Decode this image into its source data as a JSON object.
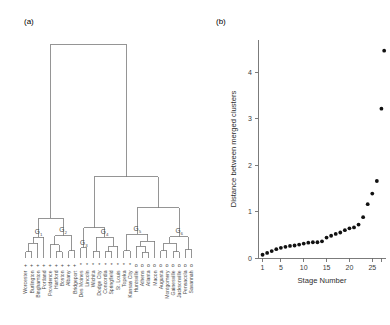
{
  "figure": {
    "panel_a_label": "(a)",
    "panel_b_label": "(b)"
  },
  "panel_a": {
    "type": "dendrogram",
    "group_labels": [
      "G",
      "G",
      "G",
      "G",
      "G",
      "G"
    ],
    "group_subscripts": [
      "1",
      "2",
      "3",
      "4",
      "5",
      "6"
    ],
    "leaves": [
      {
        "name": "Worcester",
        "symbol": "+",
        "group": "G1"
      },
      {
        "name": "Burlington",
        "symbol": "+",
        "group": "G1"
      },
      {
        "name": "Binghamton",
        "symbol": "+",
        "group": "G1"
      },
      {
        "name": "Portland",
        "symbol": "+",
        "group": "G1"
      },
      {
        "name": "Providence",
        "symbol": "+",
        "group": "G2"
      },
      {
        "name": "Hartford",
        "symbol": "+",
        "group": "G2"
      },
      {
        "name": "Boston",
        "symbol": "+",
        "group": "G2"
      },
      {
        "name": "Albany",
        "symbol": "+",
        "group": "G2"
      },
      {
        "name": "Bridgeport",
        "symbol": "+",
        "group": "G2"
      },
      {
        "name": "Des Moines",
        "symbol": "*",
        "group": "G3"
      },
      {
        "name": "Lincoln",
        "symbol": "*",
        "group": "G3"
      },
      {
        "name": "Wichita",
        "symbol": "*",
        "group": "G4"
      },
      {
        "name": "Dodge City",
        "symbol": "*",
        "group": "G4"
      },
      {
        "name": "Concordia",
        "symbol": "*",
        "group": "G4"
      },
      {
        "name": "Springfield",
        "symbol": "*",
        "group": "G4"
      },
      {
        "name": "St. Louis",
        "symbol": "*",
        "group": "G4"
      },
      {
        "name": "Topeka",
        "symbol": "*",
        "group": "G5"
      },
      {
        "name": "Kansas City",
        "symbol": "*",
        "group": "G5"
      },
      {
        "name": "Huntsville",
        "symbol": "o",
        "group": "G5"
      },
      {
        "name": "Athens",
        "symbol": "o",
        "group": "G5"
      },
      {
        "name": "Atlanta",
        "symbol": "o",
        "group": "G5"
      },
      {
        "name": "Macon",
        "symbol": "o",
        "group": "G5"
      },
      {
        "name": "Augusta",
        "symbol": "o",
        "group": "G6"
      },
      {
        "name": "Montgomery",
        "symbol": "o",
        "group": "G6"
      },
      {
        "name": "Gainesville",
        "symbol": "o",
        "group": "G6"
      },
      {
        "name": "Jacksonville",
        "symbol": "o",
        "group": "G6"
      },
      {
        "name": "Pensacola",
        "symbol": "o",
        "group": "G6"
      },
      {
        "name": "Savannah",
        "symbol": "o",
        "group": "G6"
      }
    ]
  },
  "chart_data": [
    {
      "type": "dendrogram",
      "title": "(a)",
      "labels": [
        "Worcester",
        "Burlington",
        "Binghamton",
        "Portland",
        "Providence",
        "Hartford",
        "Boston",
        "Albany",
        "Bridgeport",
        "Des Moines",
        "Lincoln",
        "Wichita",
        "Dodge City",
        "Concordia",
        "Springfield",
        "St. Louis",
        "Topeka",
        "Kansas City",
        "Huntsville",
        "Athens",
        "Atlanta",
        "Macon",
        "Augusta",
        "Montgomery",
        "Gainesville",
        "Jacksonville",
        "Pensacola",
        "Savannah"
      ],
      "clusters": [
        "G1",
        "G2",
        "G3",
        "G4",
        "G5",
        "G6"
      ],
      "orientation": "vertical",
      "grid": false,
      "legend": false
    },
    {
      "type": "scatter",
      "title": "(b)",
      "xlabel": "Stage Number",
      "ylabel": "Distance between merged clusters",
      "xlim": [
        0,
        28
      ],
      "ylim": [
        0,
        4.7
      ],
      "xticks": [
        1,
        5,
        10,
        15,
        20,
        25
      ],
      "xtick_labels": [
        "1",
        "5",
        "10",
        "15",
        "20",
        "25"
      ],
      "yticks": [
        0,
        1,
        2,
        3,
        4
      ],
      "ytick_labels": [
        "0",
        "1",
        "2",
        "3",
        "4"
      ],
      "grid": false,
      "legend": false,
      "x": [
        1,
        2,
        3,
        4,
        5,
        6,
        7,
        8,
        9,
        10,
        11,
        12,
        13,
        14,
        15,
        16,
        17,
        18,
        19,
        20,
        21,
        22,
        23,
        24,
        25,
        26,
        27
      ],
      "y": [
        0.07,
        0.11,
        0.15,
        0.19,
        0.22,
        0.24,
        0.26,
        0.27,
        0.29,
        0.31,
        0.33,
        0.34,
        0.34,
        0.36,
        0.44,
        0.48,
        0.52,
        0.55,
        0.6,
        0.64,
        0.66,
        0.72,
        0.88,
        1.16,
        1.39,
        1.66,
        3.22
      ],
      "values": [
        0.07,
        0.11,
        0.15,
        0.19,
        0.22,
        0.24,
        0.26,
        0.27,
        0.29,
        0.31,
        0.33,
        0.34,
        0.34,
        0.36,
        0.44,
        0.48,
        0.52,
        0.55,
        0.6,
        0.64,
        0.66,
        0.72,
        0.88,
        1.16,
        1.39,
        1.66,
        3.22
      ],
      "extra_point": {
        "x": 27.6,
        "y": 4.47
      }
    }
  ]
}
